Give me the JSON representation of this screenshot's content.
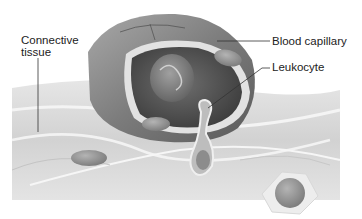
{
  "figure": {
    "type": "anatomical-illustration",
    "colors": {
      "background": "#ffffff",
      "tissue": "#d9d9d9",
      "capillary_outer": "#8a8a8a",
      "capillary_inner": "#5e5e5e",
      "nucleus": "#9a9a9a",
      "label_text": "#222222",
      "leader_line": "#333333"
    }
  },
  "labels": {
    "connective_tissue": {
      "line1": "Connective",
      "line2": "tissue"
    },
    "blood_capillary": "Blood capillary",
    "leukocyte": "Leukocyte"
  }
}
